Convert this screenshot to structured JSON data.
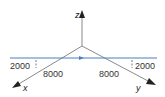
{
  "diagram": {
    "axes": {
      "x_label": "x",
      "y_label": "y",
      "z_label": "z"
    },
    "path_line": {
      "color": "#4a7fc1",
      "direction": "along y-direction (left to right)"
    },
    "dimensions": {
      "left_offset": "2000",
      "left_distance": "8000",
      "right_distance": "8000",
      "right_offset": "2000"
    },
    "colors": {
      "axis": "#8a8a8a",
      "arrowhead": "#222222",
      "text": "#333333"
    }
  }
}
